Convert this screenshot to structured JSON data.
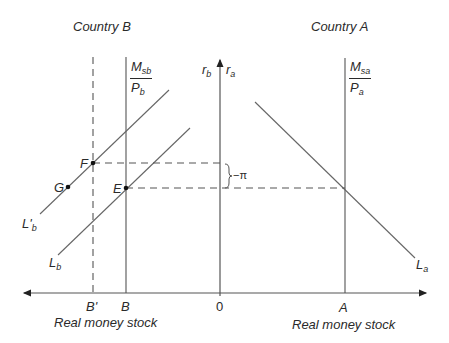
{
  "diagram": {
    "titles": {
      "left": "Country B",
      "right": "Country A"
    },
    "axes": {
      "vertical_left_label": "r",
      "vertical_left_sub": "b",
      "vertical_right_label": "r",
      "vertical_right_sub": "a",
      "x_left_label": "Real money stock",
      "x_right_label": "Real money stock",
      "ticks": [
        "B'",
        "B",
        "0",
        "A"
      ]
    },
    "supply_b": {
      "num": "M",
      "num_sub": "sb",
      "den": "P",
      "den_sub": "b"
    },
    "supply_a": {
      "num": "M",
      "num_sub": "sa",
      "den": "P",
      "den_sub": "a"
    },
    "curves": {
      "lb_prime": {
        "label": "L",
        "prime": "'",
        "sub": "b"
      },
      "lb": {
        "label": "L",
        "sub": "b"
      },
      "la": {
        "label": "L",
        "sub": "a"
      }
    },
    "points": {
      "F": "F",
      "E": "E",
      "G": "G"
    },
    "gap_label": "−π",
    "colors": {
      "line": "#555555",
      "text": "#2a2a2a",
      "background": "#ffffff"
    }
  }
}
